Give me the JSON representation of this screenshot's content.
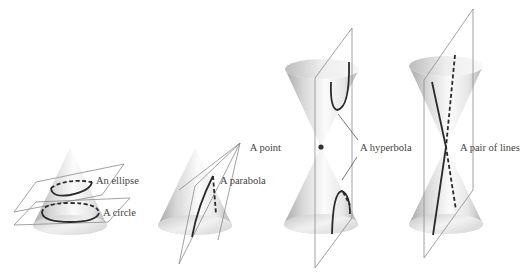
{
  "figure": {
    "panels": [
      {
        "id": "circle-ellipse",
        "labels": [
          "An ellipse",
          "A circle"
        ]
      },
      {
        "id": "parabola",
        "labels": [
          "A parabola"
        ]
      },
      {
        "id": "point-hyperbola",
        "labels": [
          "A point",
          "A hyperbola"
        ]
      },
      {
        "id": "pair-of-lines",
        "labels": [
          "A pair of lines"
        ]
      }
    ]
  },
  "labels": {
    "ellipse": "An ellipse",
    "circle": "A circle",
    "parabola": "A parabola",
    "point": "A point",
    "hyperbola": "A hyperbola",
    "lines": "A pair of lines"
  },
  "colors": {
    "background": "#ffffff",
    "cone_light": "#f4f4f4",
    "cone_dark": "#9a9a9a",
    "curve": "#2a2a2a",
    "plane": "#8a8a8a",
    "text": "#444444"
  }
}
